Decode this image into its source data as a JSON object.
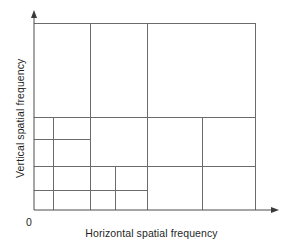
{
  "figure": {
    "name": "spatial-frequency-subband-partition",
    "axes": {
      "x_label": "Horizontal spatial frequency",
      "y_label": "Vertical spatial frequency",
      "origin_label": "0"
    },
    "colors": {
      "line": "#6b6b6b",
      "axis": "#4d4d4d",
      "text": "#1f1f1f",
      "background": "#ffffff"
    }
  },
  "chart_data": {
    "type": "diagram",
    "title": "",
    "xlabel": "Horizontal spatial frequency",
    "ylabel": "Vertical spatial frequency",
    "xlim": [
      34,
      255
    ],
    "ylim": [
      23,
      210
    ],
    "grid": false,
    "legend": null,
    "plot_box": {
      "x0": 34,
      "y0": 23,
      "x1": 255,
      "y1": 210
    },
    "axis_arrows": {
      "x_tip": 278,
      "y_tip": 11
    },
    "vertical_dividers": [
      {
        "x": 53,
        "y_top": 117,
        "y_bottom": 210
      },
      {
        "x": 90,
        "y_top": 117,
        "y_bottom": 210
      },
      {
        "x": 115,
        "y_top": 166,
        "y_bottom": 210
      },
      {
        "x": 147,
        "y_top": 23,
        "y_bottom": 210
      },
      {
        "x": 202,
        "y_top": 117,
        "y_bottom": 210
      },
      {
        "x": 90,
        "y_top": 23,
        "y_bottom": 23
      }
    ],
    "horizontal_dividers": [
      {
        "y": 117,
        "x_left": 34,
        "x_right": 255
      },
      {
        "y": 139,
        "x_left": 34,
        "x_right": 90
      },
      {
        "y": 166,
        "x_left": 34,
        "x_right": 255
      },
      {
        "y": 190,
        "x_left": 34,
        "x_right": 147
      }
    ],
    "segments": [
      {
        "id": "box-top",
        "x1": 34,
        "y1": 23,
        "x2": 255,
        "y2": 23
      },
      {
        "id": "box-right",
        "x1": 255,
        "y1": 23,
        "x2": 255,
        "y2": 210
      },
      {
        "id": "v-90-upper",
        "x1": 90,
        "y1": 23,
        "x2": 90,
        "y2": 117
      },
      {
        "id": "v-147-full",
        "x1": 147,
        "y1": 23,
        "x2": 147,
        "y2": 210
      },
      {
        "id": "h-117-full",
        "x1": 34,
        "y1": 117,
        "x2": 255,
        "y2": 117
      },
      {
        "id": "v-53-lower",
        "x1": 53,
        "y1": 117,
        "x2": 53,
        "y2": 210
      },
      {
        "id": "v-90-lower",
        "x1": 90,
        "y1": 117,
        "x2": 90,
        "y2": 210
      },
      {
        "id": "v-202-lower",
        "x1": 202,
        "y1": 117,
        "x2": 202,
        "y2": 210
      },
      {
        "id": "h-139-short",
        "x1": 34,
        "y1": 139,
        "x2": 90,
        "y2": 139
      },
      {
        "id": "h-166-full",
        "x1": 34,
        "y1": 166,
        "x2": 255,
        "y2": 166
      },
      {
        "id": "v-115-bottom",
        "x1": 115,
        "y1": 166,
        "x2": 115,
        "y2": 210
      },
      {
        "id": "h-190-short",
        "x1": 34,
        "y1": 190,
        "x2": 147,
        "y2": 190
      }
    ]
  }
}
